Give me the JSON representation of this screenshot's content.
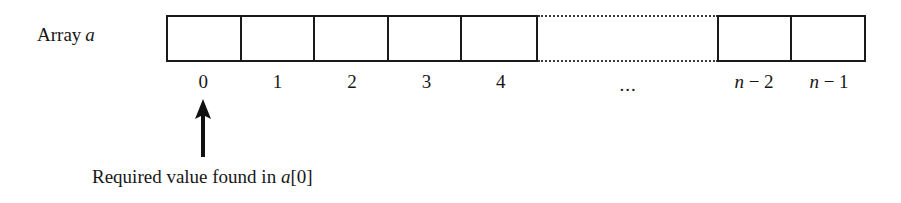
{
  "figure": {
    "array_label": {
      "text": "Array",
      "variable": "a"
    },
    "index_labels": {
      "i0": "0",
      "i1": "1",
      "i2": "2",
      "i3": "3",
      "i4": "4",
      "ellipsis": "...",
      "n_minus_2_var": "n",
      "n_minus_2_rest": " − 2",
      "n_minus_1_var": "n",
      "n_minus_1_rest": " − 1"
    },
    "caption": {
      "prefix": "Required value found in ",
      "variable": "a",
      "suffix": "[0]"
    },
    "colors": {
      "stroke": "#1a1a1a",
      "dotted": "#3a3a3a",
      "text": "#171717",
      "background": "#ffffff"
    }
  }
}
